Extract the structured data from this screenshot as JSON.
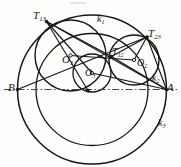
{
  "figure": {
    "domain": "geometry-diagram",
    "caption": "",
    "width": 181,
    "height": 167,
    "background": "#fdfdfc",
    "stroke_color": "#161616"
  },
  "labels": {
    "T13": {
      "base": "T",
      "sub": "13",
      "x": 33,
      "y": 10
    },
    "k1": {
      "base": "k",
      "sub": "1",
      "x": 97,
      "y": 14
    },
    "T23": {
      "base": "T",
      "sub": "23",
      "x": 148,
      "y": 28
    },
    "T12": {
      "base": "T",
      "sub": "12",
      "x": 112,
      "y": 47
    },
    "O1": {
      "base": "O",
      "sub": "1",
      "x": 62,
      "y": 54
    },
    "O2": {
      "base": "O",
      "sub": "2",
      "x": 137,
      "y": 58
    },
    "O3": {
      "base": "O",
      "sub": "3",
      "x": 85,
      "y": 68
    },
    "k2": {
      "base": "k",
      "sub": "2",
      "x": 152,
      "y": 73
    },
    "B": {
      "base": "B",
      "sub": "",
      "x": 8,
      "y": 82
    },
    "A": {
      "base": "A",
      "sub": "",
      "x": 167,
      "y": 82
    },
    "k3": {
      "base": "k",
      "sub": "3",
      "x": 158,
      "y": 118
    }
  },
  "points": {
    "A": {
      "x": 166.5,
      "y": 89.5
    },
    "B": {
      "x": 17.5,
      "y": 89.5
    },
    "T13": {
      "x": 46.5,
      "y": 21.5
    },
    "T23": {
      "x": 147.0,
      "y": 37.0
    },
    "T12": {
      "x": 111.5,
      "y": 56.5
    },
    "O1": {
      "x": 70.5,
      "y": 55.5
    },
    "O2": {
      "x": 134.0,
      "y": 60.0
    },
    "O3": {
      "x": 92.0,
      "y": 73.0
    },
    "P_bottom": {
      "x": 88.0,
      "y": 90.5
    }
  },
  "circles": {
    "k3": {
      "cx": 92.0,
      "cy": 89.5,
      "r": 74.5,
      "name": "k3-large-circle"
    },
    "k1": {
      "cx": 70.5,
      "cy": 55.5,
      "r": 35.5,
      "name": "k1-circle"
    },
    "k2": {
      "cx": 134.0,
      "cy": 60.0,
      "r": 25.0,
      "name": "k2-circle"
    },
    "k0": {
      "cx": 92.0,
      "cy": 89.5,
      "r": 56.0,
      "name": "upper-arc-circle"
    },
    "k4": {
      "cx": 92.0,
      "cy": 73.0,
      "r": 19.0,
      "name": "k4-small-circle"
    }
  },
  "segments": [
    {
      "name": "chord-B-T23",
      "x1": 17.5,
      "y1": 89.5,
      "x2": 147.0,
      "y2": 37.0
    },
    {
      "name": "chord-T13-A",
      "x1": 46.5,
      "y1": 21.5,
      "x2": 166.5,
      "y2": 89.5
    },
    {
      "name": "seg-T13-T12",
      "x1": 46.5,
      "y1": 21.5,
      "x2": 111.5,
      "y2": 56.5
    },
    {
      "name": "seg-T13-O3",
      "x1": 46.5,
      "y1": 21.5,
      "x2": 92.0,
      "y2": 73.0
    },
    {
      "name": "seg-T13-Pbot",
      "x1": 46.5,
      "y1": 21.5,
      "x2": 88.0,
      "y2": 90.5
    },
    {
      "name": "seg-O1-T12",
      "x1": 70.5,
      "y1": 55.5,
      "x2": 134.0,
      "y2": 60.0
    },
    {
      "name": "seg-T12-T23",
      "x1": 111.5,
      "y1": 56.5,
      "x2": 147.0,
      "y2": 37.0
    },
    {
      "name": "seg-T12-A",
      "x1": 111.5,
      "y1": 56.5,
      "x2": 166.5,
      "y2": 89.5
    },
    {
      "name": "seg-T23-A",
      "x1": 147.0,
      "y1": 37.0,
      "x2": 166.5,
      "y2": 89.5
    },
    {
      "name": "seg-O3-A",
      "x1": 92.0,
      "y1": 73.0,
      "x2": 166.5,
      "y2": 89.5
    },
    {
      "name": "seg-O2-T23",
      "x1": 134.0,
      "y1": 60.0,
      "x2": 147.0,
      "y2": 37.0
    }
  ],
  "axis_line": {
    "name": "line-B-A",
    "x1": 4.0,
    "y1": 89.5,
    "x2": 178.0,
    "y2": 89.5,
    "style": "dash-dot"
  }
}
